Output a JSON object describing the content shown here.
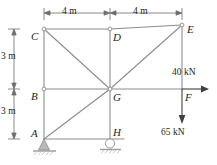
{
  "figure": {
    "type": "structural-truss-frame-diagram",
    "colors": {
      "member": "#8c8c8c",
      "dimension": "#6d6d6d",
      "text": "#231f20",
      "support_fill": "#b8b8b8",
      "joint_fill": "#ffffff",
      "background": "#ffffff"
    },
    "joints": [
      {
        "id": "A",
        "label": "A",
        "x": 44,
        "y": 139,
        "label_x": 32,
        "label_y": 130
      },
      {
        "id": "B",
        "label": "B",
        "x": 44,
        "y": 89,
        "label_x": 31,
        "label_y": 91
      },
      {
        "id": "C",
        "label": "C",
        "x": 44,
        "y": 29,
        "label_x": 31,
        "label_y": 31
      },
      {
        "id": "D",
        "label": "D",
        "x": 110,
        "y": 29,
        "label_x": 114,
        "label_y": 33
      },
      {
        "id": "E",
        "label": "E",
        "x": 182,
        "y": 25,
        "label_x": 187,
        "label_y": 27
      },
      {
        "id": "G",
        "label": "G",
        "x": 110,
        "y": 89,
        "label_x": 114,
        "label_y": 92
      },
      {
        "id": "H",
        "label": "H",
        "x": 110,
        "y": 139,
        "label_x": 114,
        "label_y": 128
      },
      {
        "id": "F",
        "label": "F",
        "x": 182,
        "y": 89,
        "label_x": 186,
        "label_y": 93
      }
    ],
    "members": [
      {
        "from": "C",
        "to": "D",
        "name": "member-C-D"
      },
      {
        "from": "D",
        "to": "E",
        "name": "member-D-E"
      },
      {
        "from": "C",
        "to": "B",
        "name": "member-C-B"
      },
      {
        "from": "B",
        "to": "A",
        "name": "member-B-A"
      },
      {
        "from": "B",
        "to": "G",
        "name": "member-B-G"
      },
      {
        "from": "G",
        "to": "F",
        "name": "member-G-F"
      },
      {
        "from": "D",
        "to": "G",
        "name": "member-D-G"
      },
      {
        "from": "G",
        "to": "H",
        "name": "member-G-H"
      },
      {
        "from": "A",
        "to": "H",
        "name": "member-A-H"
      },
      {
        "from": "C",
        "to": "G",
        "name": "diagonal-C-G"
      },
      {
        "from": "G",
        "to": "E",
        "name": "diagonal-G-E"
      },
      {
        "from": "A",
        "to": "G",
        "name": "diagonal-A-G"
      },
      {
        "from": "E",
        "to": "F",
        "name": "member-E-F"
      }
    ],
    "supports": [
      {
        "id": "A",
        "kind": "pin-support",
        "x": 44,
        "y": 139
      },
      {
        "id": "H",
        "kind": "roller-support",
        "x": 110,
        "y": 139
      }
    ],
    "dimensions": {
      "horizontal": [
        {
          "label": "4 m",
          "from_x": 44,
          "to_x": 110,
          "y": 13,
          "text_x": 62,
          "text_y": 8
        },
        {
          "label": "4 m",
          "from_x": 110,
          "to_x": 182,
          "y": 13,
          "text_x": 133,
          "text_y": 8
        }
      ],
      "vertical": [
        {
          "label": "3 m",
          "from_y": 29,
          "to_y": 89,
          "x": 14,
          "text_x": 2,
          "text_y": 52
        },
        {
          "label": "3 m",
          "from_y": 89,
          "to_y": 139,
          "x": 14,
          "text_x": 2,
          "text_y": 107
        }
      ]
    },
    "loads": [
      {
        "name": "horizontal-load",
        "magnitude": "40 kN",
        "direction": "right",
        "at": "F",
        "from_x": 110,
        "from_y": 89,
        "to_x": 210,
        "to_y": 89,
        "text_x": 172,
        "text_y": 69
      },
      {
        "name": "vertical-load",
        "magnitude": "65 kN",
        "direction": "down",
        "at": "F",
        "from_x": 182,
        "from_y": 89,
        "to_x": 182,
        "to_y": 123,
        "text_x": 162,
        "text_y": 129
      }
    ]
  }
}
